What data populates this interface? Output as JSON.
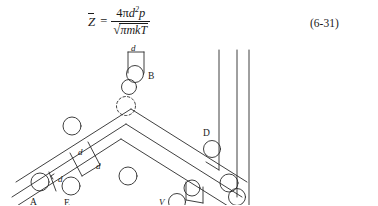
{
  "page": {
    "background_color": "#ffffff",
    "ink_color": "#1a1a1a"
  },
  "equation": {
    "lhs_variable": "Z",
    "lhs_has_overbar": true,
    "equals": "=",
    "numerator_prefix": "4",
    "numerator_pi": "π",
    "numerator_d": "d",
    "numerator_exponent": "2",
    "numerator_p": "p",
    "denominator_radical": "√",
    "denominator_body": "πmkT",
    "number": "(6-31)"
  },
  "figure": {
    "labels": {
      "a": "A",
      "b": "B",
      "c": "C",
      "d_point": "D",
      "e": "E",
      "v": "V",
      "diameter_top": "d",
      "diameter_band_upper": "d",
      "diameter_band_lower": "d",
      "diameter_left_small": "d",
      "diameter_bottom": "d"
    }
  }
}
